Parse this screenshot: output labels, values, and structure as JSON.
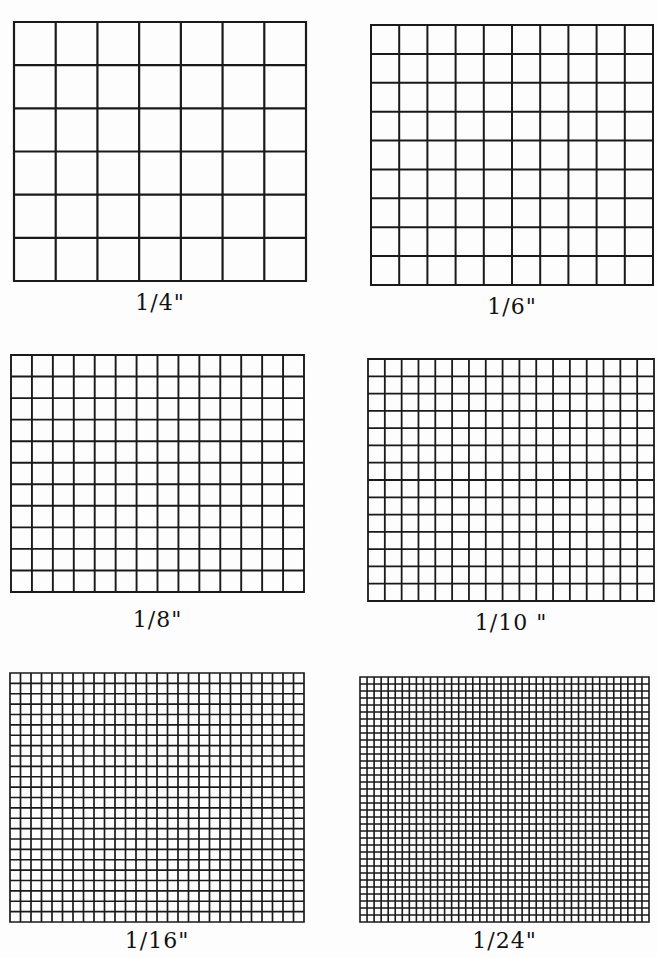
{
  "page": {
    "background": "#fdfdfd",
    "line_color": "#1a1a1a"
  },
  "grids": [
    {
      "label": "1/4\"",
      "spacing": "1/4 inch",
      "cols": 7,
      "rows": 6,
      "box": {
        "x": 14,
        "y": 22,
        "w": 292,
        "h": 259
      },
      "line_width": 2.2,
      "label_pos": {
        "x": 14,
        "y": 290,
        "w": 292
      }
    },
    {
      "label": "1/6\"",
      "spacing": "1/6 inch",
      "cols": 10,
      "rows": 9,
      "box": {
        "x": 371,
        "y": 25,
        "w": 282,
        "h": 260
      },
      "line_width": 2.0,
      "label_pos": {
        "x": 371,
        "y": 294,
        "w": 282
      }
    },
    {
      "label": "1/8\"",
      "spacing": "1/8 inch",
      "cols": 14,
      "rows": 11,
      "box": {
        "x": 11,
        "y": 355,
        "w": 293,
        "h": 237
      },
      "line_width": 1.9,
      "label_pos": {
        "x": 11,
        "y": 607,
        "w": 293
      }
    },
    {
      "label": "1/10 \"",
      "spacing": "1/10 inch",
      "cols": 17,
      "rows": 14,
      "box": {
        "x": 368,
        "y": 359,
        "w": 286,
        "h": 242
      },
      "line_width": 1.8,
      "label_pos": {
        "x": 368,
        "y": 610,
        "w": 286
      }
    },
    {
      "label": "1/16\"",
      "spacing": "1/16 inch",
      "cols": 28,
      "rows": 24,
      "box": {
        "x": 10,
        "y": 673,
        "w": 294,
        "h": 249
      },
      "line_width": 1.7,
      "label_pos": {
        "x": 10,
        "y": 928,
        "w": 294
      }
    },
    {
      "label": "1/24\"",
      "spacing": "1/24 inch",
      "cols": 41,
      "rows": 35,
      "box": {
        "x": 360,
        "y": 677,
        "w": 289,
        "h": 245
      },
      "line_width": 1.6,
      "label_pos": {
        "x": 360,
        "y": 928,
        "w": 289
      }
    }
  ]
}
